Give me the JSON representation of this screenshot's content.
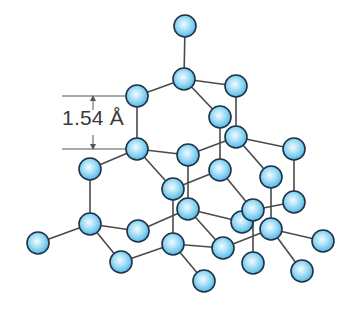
{
  "diagram": {
    "bond_length_label": "1.54 Å",
    "colors": {
      "atom_fill_center": "#f2fbff",
      "atom_fill_edge": "#4fb6e6",
      "atom_outline": "#1f3347",
      "bond": "#4a4a4a",
      "dimension_line": "#555555",
      "label_text": "#3a3a3a"
    },
    "atom_radius": 11,
    "atoms": [
      {
        "id": "a1",
        "x": 185,
        "y": 26
      },
      {
        "id": "a2",
        "x": 184,
        "y": 79
      },
      {
        "id": "a3",
        "x": 236,
        "y": 86
      },
      {
        "id": "a4",
        "x": 137,
        "y": 96
      },
      {
        "id": "a5",
        "x": 220,
        "y": 117
      },
      {
        "id": "a6",
        "x": 236,
        "y": 137
      },
      {
        "id": "a7",
        "x": 137,
        "y": 149
      },
      {
        "id": "a8",
        "x": 188,
        "y": 155
      },
      {
        "id": "a9",
        "x": 294,
        "y": 149
      },
      {
        "id": "a10",
        "x": 90,
        "y": 169
      },
      {
        "id": "a11",
        "x": 220,
        "y": 170
      },
      {
        "id": "a12",
        "x": 271,
        "y": 177
      },
      {
        "id": "a13",
        "x": 173,
        "y": 189
      },
      {
        "id": "a14",
        "x": 294,
        "y": 202
      },
      {
        "id": "a15",
        "x": 188,
        "y": 209
      },
      {
        "id": "a16",
        "x": 242,
        "y": 222
      },
      {
        "id": "a17",
        "x": 253,
        "y": 210
      },
      {
        "id": "a18",
        "x": 90,
        "y": 224
      },
      {
        "id": "a19",
        "x": 138,
        "y": 231
      },
      {
        "id": "a20",
        "x": 271,
        "y": 229
      },
      {
        "id": "a21",
        "x": 38,
        "y": 243
      },
      {
        "id": "a22",
        "x": 173,
        "y": 244
      },
      {
        "id": "a23",
        "x": 223,
        "y": 248
      },
      {
        "id": "a24",
        "x": 323,
        "y": 241
      },
      {
        "id": "a25",
        "x": 121,
        "y": 262
      },
      {
        "id": "a26",
        "x": 253,
        "y": 263
      },
      {
        "id": "a27",
        "x": 302,
        "y": 271
      },
      {
        "id": "a28",
        "x": 204,
        "y": 281
      }
    ],
    "bonds": [
      [
        "a1",
        "a2"
      ],
      [
        "a2",
        "a4"
      ],
      [
        "a2",
        "a3"
      ],
      [
        "a2",
        "a5"
      ],
      [
        "a4",
        "a7"
      ],
      [
        "a3",
        "a6"
      ],
      [
        "a5",
        "a11"
      ],
      [
        "a7",
        "a8"
      ],
      [
        "a7",
        "a10"
      ],
      [
        "a7",
        "a13"
      ],
      [
        "a8",
        "a6"
      ],
      [
        "a8",
        "a15"
      ],
      [
        "a6",
        "a9"
      ],
      [
        "a6",
        "a12"
      ],
      [
        "a9",
        "a14"
      ],
      [
        "a13",
        "a11"
      ],
      [
        "a13",
        "a22"
      ],
      [
        "a11",
        "a17"
      ],
      [
        "a12",
        "a20"
      ],
      [
        "a14",
        "a17"
      ],
      [
        "a17",
        "a26"
      ],
      [
        "a10",
        "a18"
      ],
      [
        "a18",
        "a21"
      ],
      [
        "a18",
        "a19"
      ],
      [
        "a18",
        "a25"
      ],
      [
        "a19",
        "a15"
      ],
      [
        "a15",
        "a16"
      ],
      [
        "a15",
        "a23"
      ],
      [
        "a25",
        "a22"
      ],
      [
        "a22",
        "a23"
      ],
      [
        "a22",
        "a28"
      ],
      [
        "a23",
        "a20"
      ],
      [
        "a20",
        "a24"
      ],
      [
        "a20",
        "a27"
      ]
    ],
    "dimension": {
      "top_line": {
        "x1": 62,
        "y1": 96,
        "x2": 126,
        "y2": 96
      },
      "bottom_line": {
        "x1": 62,
        "y1": 149,
        "x2": 126,
        "y2": 149
      },
      "arrow_x": 93
    }
  }
}
